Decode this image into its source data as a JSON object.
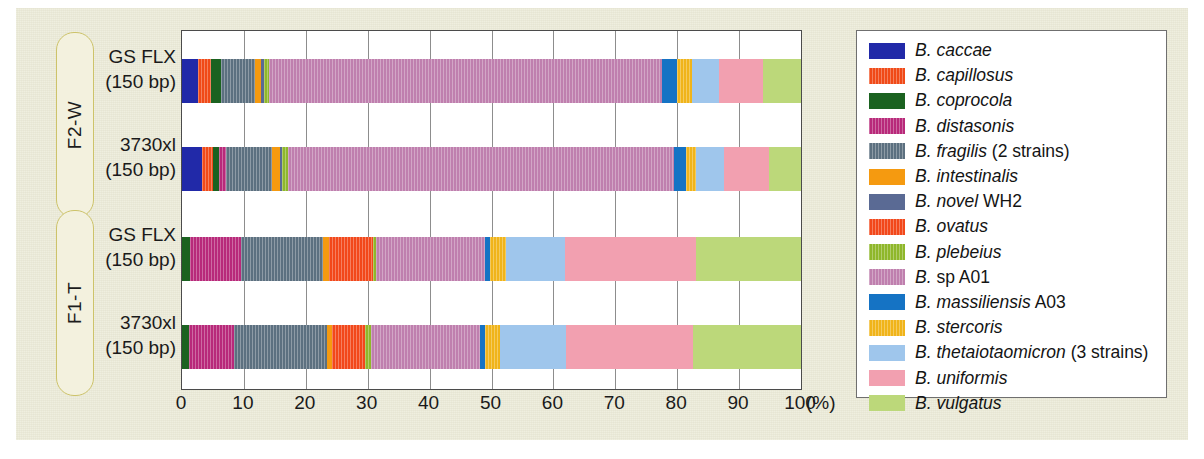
{
  "chart_data": {
    "type": "bar",
    "orientation": "horizontal",
    "stacked": true,
    "title": "",
    "xlabel": "(%)",
    "ylabel": "",
    "xlim": [
      0,
      100
    ],
    "xticks": [
      "0",
      "10",
      "20",
      "30",
      "40",
      "50",
      "60",
      "70",
      "80",
      "90",
      "100"
    ],
    "x_unit": "(%)",
    "grid": true,
    "legend_position": "right",
    "categories": [
      "GS FLX (150 bp)",
      "3730xl (150 bp)",
      "GS FLX (150 bp)",
      "3730xl (150 bp)"
    ],
    "groups": [
      {
        "label": "F2-W",
        "rows": [
          0,
          1
        ]
      },
      {
        "label": "F1-T",
        "rows": [
          2,
          3
        ]
      }
    ],
    "rows": [
      {
        "group": "F2-W",
        "line1": "GS FLX",
        "line2": "(150 bp)",
        "values": [
          2.6,
          2.1,
          1.6,
          0.0,
          5.5,
          1.0,
          0.5,
          0.0,
          0.7,
          63.6,
          2.3,
          2.5,
          4.4,
          7.0,
          6.2
        ]
      },
      {
        "group": "F2-W",
        "line1": "3730xl",
        "line2": "(150 bp)",
        "values": [
          3.2,
          1.8,
          1.0,
          1.1,
          7.4,
          1.3,
          0.4,
          0.0,
          1.0,
          62.3,
          1.9,
          1.7,
          4.4,
          7.3,
          5.2
        ]
      },
      {
        "group": "F1-T",
        "line1": "GS FLX",
        "line2": "(150 bp)",
        "values": [
          0.0,
          0.0,
          1.3,
          8.3,
          13.2,
          0.9,
          0.0,
          7.2,
          0.4,
          17.6,
          0.9,
          2.6,
          9.4,
          21.2,
          17.0
        ]
      },
      {
        "group": "F1-T",
        "line1": "3730xl",
        "line2": "(150 bp)",
        "values": [
          0.0,
          0.0,
          1.1,
          7.3,
          15.1,
          0.7,
          0.0,
          5.4,
          0.9,
          17.6,
          0.8,
          2.4,
          10.7,
          20.5,
          17.5
        ]
      }
    ],
    "series": [
      {
        "name": "B. caccae",
        "italic": "B. caccae",
        "plain": "",
        "color": "#2129a8",
        "hatch": false
      },
      {
        "name": "B. capillosus",
        "italic": "B. capillosus",
        "plain": "",
        "color": "#f04a18",
        "hatch": true
      },
      {
        "name": "B. coprocola",
        "italic": "B. coprocola",
        "plain": "",
        "color": "#1b6220",
        "hatch": false
      },
      {
        "name": "B. distasonis",
        "italic": "B. distasonis",
        "plain": "",
        "color": "#b8297a",
        "hatch": true
      },
      {
        "name": "B. fragilis (2 strains)",
        "italic": "B. fragilis",
        "plain": " (2 strains)",
        "color": "#5c7080",
        "hatch": true
      },
      {
        "name": "B. intestinalis",
        "italic": "B. intestinalis",
        "plain": "",
        "color": "#f59a10",
        "hatch": false
      },
      {
        "name": "B. novel WH2",
        "italic": "B. novel",
        "plain": " WH2",
        "color": "#5a6a94",
        "hatch": false
      },
      {
        "name": "B. ovatus",
        "italic": "B. ovatus",
        "plain": "",
        "color": "#f2481b",
        "hatch": true
      },
      {
        "name": "B. plebeius",
        "italic": "B. plebeius",
        "plain": "",
        "color": "#8fb72b",
        "hatch": true
      },
      {
        "name": "B. sp A01",
        "italic": "B.",
        "plain": " sp A01",
        "color": "#bf7fae",
        "hatch": true
      },
      {
        "name": "B. massiliensis A03",
        "italic": "B. massiliensis",
        "plain": " A03",
        "color": "#1573c4",
        "hatch": false
      },
      {
        "name": "B. stercoris",
        "italic": "B. stercoris",
        "plain": "",
        "color": "#f0b41a",
        "hatch": true
      },
      {
        "name": "B. thetaiotaomicron (3 strains)",
        "italic": "B. thetaiotaomicron",
        "plain": " (3 strains)",
        "color": "#9fc6ec",
        "hatch": false
      },
      {
        "name": "B. uniformis",
        "italic": "B. uniformis",
        "plain": "",
        "color": "#f2a0b0",
        "hatch": false
      },
      {
        "name": "B. vulgatus",
        "italic": "B. vulgatus",
        "plain": "",
        "color": "#bcd87a",
        "hatch": false
      }
    ]
  }
}
